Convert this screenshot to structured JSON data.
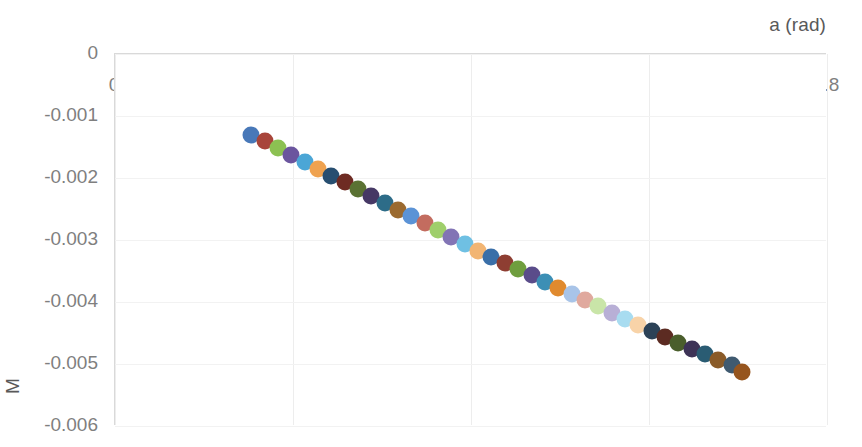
{
  "chart_data": {
    "type": "scatter",
    "title": "",
    "xlabel": "a (rad)",
    "ylabel": "M",
    "xlim": [
      0,
      0.8
    ],
    "ylim": [
      -0.006,
      0
    ],
    "xticks": [
      "0",
      "0.2",
      "0.4",
      "0.6",
      "0.8"
    ],
    "xtick_values": [
      0,
      0.2,
      0.4,
      0.6,
      0.8
    ],
    "yticks": [
      "0",
      "-0.001",
      "-0.002",
      "-0.003",
      "-0.004",
      "-0.005",
      "-0.006"
    ],
    "ytick_values": [
      0,
      -0.001,
      -0.002,
      -0.003,
      -0.004,
      -0.005,
      -0.006
    ],
    "grid": true,
    "legend": "none",
    "marker_size_px": 17,
    "vary_colors_by_point": true,
    "x": [
      0.153,
      0.168,
      0.183,
      0.198,
      0.213,
      0.228,
      0.243,
      0.258,
      0.273,
      0.288,
      0.303,
      0.318,
      0.333,
      0.348,
      0.363,
      0.378,
      0.393,
      0.408,
      0.423,
      0.438,
      0.453,
      0.468,
      0.483,
      0.498,
      0.513,
      0.528,
      0.543,
      0.558,
      0.573,
      0.588,
      0.603,
      0.618,
      0.633,
      0.648,
      0.663,
      0.678,
      0.693,
      0.704
    ],
    "y": [
      -0.00131,
      -0.00141,
      -0.00152,
      -0.00163,
      -0.00174,
      -0.00185,
      -0.00196,
      -0.00207,
      -0.00218,
      -0.00229,
      -0.0024,
      -0.00251,
      -0.00262,
      -0.00273,
      -0.00284,
      -0.00295,
      -0.00306,
      -0.00317,
      -0.00327,
      -0.00337,
      -0.00347,
      -0.00357,
      -0.00367,
      -0.00377,
      -0.00387,
      -0.00397,
      -0.00407,
      -0.00417,
      -0.00427,
      -0.00437,
      -0.00447,
      -0.00457,
      -0.00466,
      -0.00475,
      -0.00484,
      -0.00493,
      -0.00502,
      -0.00513
    ],
    "colors": [
      "#4878B8",
      "#A8453A",
      "#8CC152",
      "#6B559E",
      "#4BA6D6",
      "#EFA24F",
      "#274E70",
      "#6E2B23",
      "#5A7233",
      "#463865",
      "#2D6C88",
      "#9B6A2F",
      "#5B93D6",
      "#C36C5F",
      "#9FCF6B",
      "#8274B5",
      "#6FC0E3",
      "#F2B573",
      "#3A6FA8",
      "#8E3E32",
      "#6F9E3E",
      "#5A4C8A",
      "#3C8FB5",
      "#E08A2E",
      "#A8C4E8",
      "#E0A99E",
      "#C9E5A8",
      "#B8AFD6",
      "#A8DCF0",
      "#F8D3A8",
      "#2C4257",
      "#5C2B22",
      "#4A5E2C",
      "#3D3357",
      "#2A5C73",
      "#8A5B28",
      "#3F5A70",
      "#96551E"
    ],
    "color_semantics": [
      "blue",
      "dark-red",
      "green",
      "purple",
      "light-blue",
      "orange",
      "dark-navy",
      "dark-brown",
      "dark-olive",
      "dark-purple",
      "dark-teal",
      "dark-amber",
      "blue",
      "muted-red",
      "light-green",
      "lavender-purple",
      "sky-blue",
      "peach",
      "blue",
      "dark-red",
      "green",
      "purple",
      "teal-blue",
      "orange",
      "pale-blue",
      "pale-salmon",
      "pale-green",
      "pale-lavender",
      "pale-sky",
      "pale-peach",
      "deep-navy",
      "deep-brown",
      "deep-olive",
      "deep-purple",
      "deep-teal",
      "deep-amber",
      "slate-blue",
      "burnt-orange"
    ]
  },
  "axes": {
    "x_title": "a (rad)",
    "y_title": "M"
  },
  "style": {
    "plot_background": "#ffffff",
    "gridline_color": "#ededed",
    "axis_line_color": "#d9d9d9",
    "tick_label_color": "#7f7f7f",
    "axis_title_color": "#595959"
  }
}
